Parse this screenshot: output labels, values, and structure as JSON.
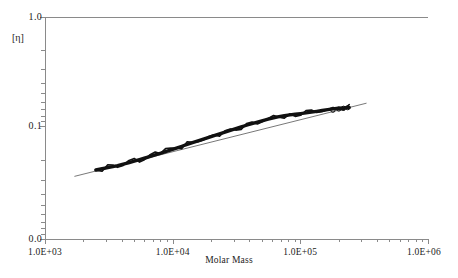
{
  "chart_data": {
    "type": "line",
    "title": "",
    "xlabel": "Molar Mass",
    "ylabel": "[η]",
    "xscale": "log",
    "yscale": "log",
    "xlim": [
      1000,
      1000000
    ],
    "ylim": [
      0.0,
      1.0
    ],
    "grid": false,
    "legend": null,
    "xticks": [
      "1.0E+03",
      "1.0E+04",
      "1.0E+05",
      "1.0E+06"
    ],
    "xtick_values": [
      1000,
      10000,
      100000,
      1000000
    ],
    "yticks": [
      "0.0",
      "0.1",
      "1.0"
    ],
    "ytick_values": [
      0.0,
      0.1,
      1.0
    ],
    "series": [
      {
        "name": "intrinsic-viscosity-data",
        "style": "thick-noisy-trace",
        "color": "#111111",
        "x": [
          2500,
          2800,
          3100,
          3400,
          3700,
          4100,
          4500,
          5000,
          5500,
          6000,
          6600,
          7300,
          8000,
          8800,
          9700,
          10700,
          11800,
          13000,
          14300,
          15800,
          17400,
          19200,
          21100,
          23300,
          25700,
          28300,
          31200,
          34400,
          37900,
          41800,
          46100,
          50800,
          56000,
          61700,
          68000,
          75000,
          82700,
          91200,
          100500,
          110800,
          122100,
          134600,
          148400,
          163600,
          180300,
          198800,
          219100,
          241500
        ],
        "y": [
          0.0395,
          0.0405,
          0.0415,
          0.0424,
          0.0433,
          0.0446,
          0.0459,
          0.0476,
          0.0491,
          0.0506,
          0.0523,
          0.0543,
          0.0562,
          0.0583,
          0.0605,
          0.0628,
          0.0652,
          0.0678,
          0.0703,
          0.0731,
          0.0758,
          0.0787,
          0.0816,
          0.0848,
          0.0879,
          0.0912,
          0.0946,
          0.0981,
          0.1016,
          0.1051,
          0.1086,
          0.1122,
          0.1156,
          0.1188,
          0.1217,
          0.1243,
          0.1264,
          0.1281,
          0.1299,
          0.1318,
          0.1339,
          0.1362,
          0.1388,
          0.1412,
          0.1436,
          0.1455,
          0.1468,
          0.1478
        ]
      },
      {
        "name": "linear-fit-line",
        "style": "thin-straight-line",
        "color": "#555555",
        "x": [
          1700,
          330000
        ],
        "y": [
          0.0345,
          0.162
        ]
      }
    ],
    "markers": {
      "name": "open-circle-markers-high-mass",
      "shape": "circle",
      "filled": false,
      "x": [
        180000,
        200000,
        218000,
        235000
      ],
      "y": [
        0.1395,
        0.143,
        0.1455,
        0.1472
      ]
    }
  },
  "axes": {
    "y_label": "[η]",
    "y_top": "1.0",
    "y_mid": "0.1",
    "y_bottom": "0.0",
    "x_title": "Molar Mass",
    "x_ticks": [
      "1.0E+03",
      "1.0E+04",
      "1.0E+05",
      "1.0E+06"
    ]
  },
  "colors": {
    "frame": "#8a8a8a",
    "data": "#111111",
    "fit": "#555555",
    "background": "#ffffff",
    "text": "#222222"
  }
}
